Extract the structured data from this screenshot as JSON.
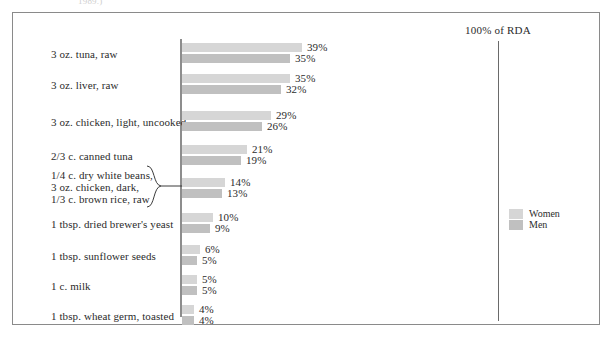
{
  "figure": {
    "top_caption": "1989.)",
    "rda_label": "100% of RDA"
  },
  "legend": {
    "items": [
      {
        "label": "Women",
        "color": "#d6d6d6",
        "key": "women"
      },
      {
        "label": "Men",
        "color": "#c0c0c0",
        "key": "men"
      }
    ]
  },
  "chart_data": {
    "type": "bar",
    "orientation": "horizontal",
    "title": "",
    "subtitle": "",
    "xlabel": "",
    "ylabel": "",
    "reference_line": {
      "label": "100% of RDA",
      "value": 100
    },
    "grid": false,
    "legend_position": "right",
    "value_suffix": "%",
    "xlim": [
      0,
      100
    ],
    "categories": [
      "3 oz. tuna, raw",
      "3 oz. liver, raw",
      "3 oz. chicken, light, uncooked",
      "2/3 c. canned tuna",
      "1/4 c. dry white beans,\n3 oz. chicken, dark,\n1/3 c. brown rice, raw",
      "1 tbsp. dried brewer's yeast",
      "1 tbsp. sunflower seeds",
      "1 c. milk",
      "1 tbsp. wheat germ, toasted"
    ],
    "series": [
      {
        "name": "Women",
        "color": "#d6d6d6",
        "values": [
          39,
          35,
          29,
          21,
          14,
          10,
          6,
          5,
          4
        ]
      },
      {
        "name": "Men",
        "color": "#c0c0c0",
        "values": [
          35,
          32,
          26,
          19,
          13,
          9,
          5,
          5,
          4
        ]
      }
    ],
    "labels": {
      "women": [
        "39%",
        "35%",
        "29%",
        "21%",
        "14%",
        "10%",
        "6%",
        "5%",
        "4%"
      ],
      "men": [
        "35%",
        "32%",
        "26%",
        "19%",
        "13%",
        "9%",
        "5%",
        "5%",
        "4%"
      ]
    }
  },
  "rows": [
    {
      "id": "tuna-raw",
      "label": "3 oz. tuna, raw",
      "lines": [
        "3 oz. tuna, raw"
      ],
      "women": {
        "value": 39,
        "text": "39%"
      },
      "men": {
        "value": 35,
        "text": "35%"
      },
      "braced": false
    },
    {
      "id": "liver-raw",
      "label": "3 oz. liver, raw",
      "lines": [
        "3 oz. liver, raw"
      ],
      "women": {
        "value": 35,
        "text": "35%"
      },
      "men": {
        "value": 32,
        "text": "32%"
      },
      "braced": false
    },
    {
      "id": "chicken-light-uncooked",
      "label": "3 oz. chicken, light, uncooked",
      "lines": [
        "3 oz. chicken, light, uncooked"
      ],
      "women": {
        "value": 29,
        "text": "29%"
      },
      "men": {
        "value": 26,
        "text": "26%"
      },
      "braced": false
    },
    {
      "id": "canned-tuna",
      "label": "2/3 c. canned tuna",
      "lines": [
        "2/3 c. canned tuna"
      ],
      "women": {
        "value": 21,
        "text": "21%"
      },
      "men": {
        "value": 19,
        "text": "19%"
      },
      "braced": false
    },
    {
      "id": "beans-chicken-dark-brown-rice",
      "label": "1/4 c. dry white beans, 3 oz. chicken, dark, 1/3 c. brown rice, raw",
      "lines": [
        "1/4 c. dry white beans,",
        "3 oz. chicken, dark,",
        "1/3 c. brown rice, raw"
      ],
      "women": {
        "value": 14,
        "text": "14%"
      },
      "men": {
        "value": 13,
        "text": "13%"
      },
      "braced": true
    },
    {
      "id": "brewers-yeast",
      "label": "1 tbsp. dried brewer's yeast",
      "lines": [
        "1 tbsp. dried brewer's yeast"
      ],
      "women": {
        "value": 10,
        "text": "10%"
      },
      "men": {
        "value": 9,
        "text": "9%"
      },
      "braced": false
    },
    {
      "id": "sunflower-seeds",
      "label": "1 tbsp. sunflower seeds",
      "lines": [
        "1 tbsp. sunflower seeds"
      ],
      "women": {
        "value": 6,
        "text": "6%"
      },
      "men": {
        "value": 5,
        "text": "5%"
      },
      "braced": false
    },
    {
      "id": "milk",
      "label": "1 c. milk",
      "lines": [
        "1 c. milk"
      ],
      "women": {
        "value": 5,
        "text": "5%"
      },
      "men": {
        "value": 5,
        "text": "5%"
      },
      "braced": false
    },
    {
      "id": "wheat-germ-toasted",
      "label": "1 tbsp. wheat germ, toasted",
      "lines": [
        "1 tbsp. wheat germ, toasted"
      ],
      "women": {
        "value": 4,
        "text": "4%"
      },
      "men": {
        "value": 4,
        "text": "4%"
      },
      "braced": false
    }
  ]
}
